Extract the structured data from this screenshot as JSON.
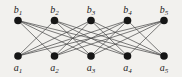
{
  "figure": {
    "background_color": "#f2f1ee",
    "node_color": "#161616",
    "edge_color": "#454545",
    "label_color": "#1c1c1c",
    "node_radius": 3.8,
    "edge_width": 0.7,
    "label_font_size": 10,
    "subscript_font_size": 7
  },
  "graph": {
    "type": "bipartite-graph",
    "description": "Complete bipartite graph K5,5 minus a perfect matching (crown graph): each a_i adjacent to every b_j with j != i",
    "top_nodes": [
      {
        "id": "b1",
        "base": "b",
        "sub": "1",
        "x": 18,
        "y": 20.5,
        "label_y": 13
      },
      {
        "id": "b2",
        "base": "b",
        "sub": "2",
        "x": 54.5,
        "y": 20.5,
        "label_y": 13
      },
      {
        "id": "b3",
        "base": "b",
        "sub": "3",
        "x": 91,
        "y": 20.5,
        "label_y": 13
      },
      {
        "id": "b4",
        "base": "b",
        "sub": "4",
        "x": 127.5,
        "y": 20.5,
        "label_y": 13
      },
      {
        "id": "b5",
        "base": "b",
        "sub": "5",
        "x": 164,
        "y": 20.5,
        "label_y": 13
      }
    ],
    "bottom_nodes": [
      {
        "id": "a1",
        "base": "a",
        "sub": "1",
        "x": 18,
        "y": 56,
        "label_y": 71
      },
      {
        "id": "a2",
        "base": "a",
        "sub": "2",
        "x": 54.5,
        "y": 56,
        "label_y": 71
      },
      {
        "id": "a3",
        "base": "a",
        "sub": "3",
        "x": 91,
        "y": 56,
        "label_y": 71
      },
      {
        "id": "a4",
        "base": "a",
        "sub": "4",
        "x": 127.5,
        "y": 56,
        "label_y": 71
      },
      {
        "id": "a5",
        "base": "a",
        "sub": "5",
        "x": 164,
        "y": 56,
        "label_y": 71
      }
    ],
    "edges": [
      [
        "a1",
        "b2"
      ],
      [
        "a1",
        "b3"
      ],
      [
        "a1",
        "b4"
      ],
      [
        "a1",
        "b5"
      ],
      [
        "a2",
        "b1"
      ],
      [
        "a2",
        "b3"
      ],
      [
        "a2",
        "b4"
      ],
      [
        "a2",
        "b5"
      ],
      [
        "a3",
        "b1"
      ],
      [
        "a3",
        "b2"
      ],
      [
        "a3",
        "b4"
      ],
      [
        "a3",
        "b5"
      ],
      [
        "a4",
        "b1"
      ],
      [
        "a4",
        "b2"
      ],
      [
        "a4",
        "b3"
      ],
      [
        "a4",
        "b5"
      ],
      [
        "a5",
        "b1"
      ],
      [
        "a5",
        "b2"
      ],
      [
        "a5",
        "b3"
      ],
      [
        "a5",
        "b4"
      ]
    ]
  }
}
